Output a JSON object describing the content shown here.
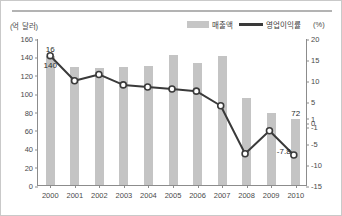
{
  "chart_data": {
    "type": "bar",
    "title": "",
    "subtitle": "",
    "xlabel": "",
    "categories": [
      "2000",
      "2001",
      "2002",
      "2003",
      "2004",
      "2005",
      "2006",
      "2007",
      "2008",
      "2009",
      "2010"
    ],
    "series": [
      {
        "name": "매출액",
        "type": "bar",
        "axis": "left",
        "color": "#c4c4c4",
        "values": [
          140,
          128,
          127,
          128,
          130,
          142,
          133,
          140,
          95,
          78,
          72
        ]
      },
      {
        "name": "영업이익률",
        "type": "line",
        "axis": "right",
        "color": "#3a3a3a",
        "values": [
          16,
          10,
          11.5,
          9,
          8.5,
          8,
          7.5,
          4,
          -7.5,
          -2,
          -7.8
        ]
      }
    ],
    "left_axis": {
      "label": "(억 달러)",
      "ticks": [
        0,
        20,
        40,
        60,
        80,
        100,
        120,
        140,
        160
      ],
      "ylim": [
        0,
        160
      ]
    },
    "right_axis": {
      "label": "(%)",
      "ticks": [
        20,
        15,
        10,
        5,
        1,
        0,
        -1,
        -5,
        -10,
        -15
      ],
      "ylim": [
        -15,
        20
      ]
    },
    "annotations": [
      {
        "text": "16",
        "category": "2000",
        "series": "영업이익률",
        "position": "above"
      },
      {
        "text": "140",
        "category": "2000",
        "series": "매출액",
        "position": "below"
      },
      {
        "text": "72",
        "category": "2010",
        "series": "매출액",
        "position": "above"
      },
      {
        "text": "-7.8",
        "category": "2010",
        "series": "영업이익률",
        "position": "left"
      }
    ],
    "grid": false,
    "legend_position": "top-right"
  },
  "legend": {
    "bar_label": "매출액",
    "line_label": "영업이익률"
  },
  "axes": {
    "left_unit": "(억 달러)",
    "right_unit": "(%)"
  }
}
